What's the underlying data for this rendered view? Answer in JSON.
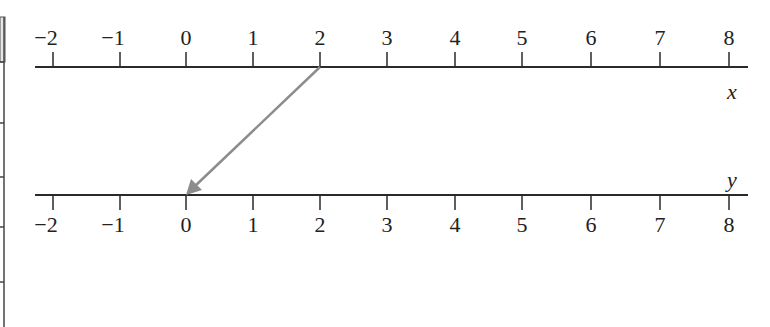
{
  "diagram": {
    "type": "mapping-diagram",
    "colors": {
      "axis": "#2a2a2a",
      "arrow": "#8c8c8c",
      "text": "#222222",
      "edge_box": "#e6e6e6"
    },
    "top_axis": {
      "variable": "x",
      "ticks": [
        "−2",
        "−1",
        "0",
        "1",
        "2",
        "3",
        "4",
        "5",
        "6",
        "7",
        "8"
      ],
      "values": [
        -2,
        -1,
        0,
        1,
        2,
        3,
        4,
        5,
        6,
        7,
        8
      ]
    },
    "bottom_axis": {
      "variable": "y",
      "ticks": [
        "−2",
        "−1",
        "0",
        "1",
        "2",
        "3",
        "4",
        "5",
        "6",
        "7",
        "8"
      ],
      "values": [
        -2,
        -1,
        0,
        1,
        2,
        3,
        4,
        5,
        6,
        7,
        8
      ]
    },
    "mapping_arrows": [
      {
        "from_x": 2,
        "to_y": 0
      }
    ]
  }
}
